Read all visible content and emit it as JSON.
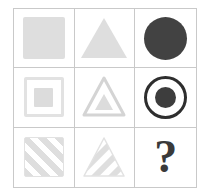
{
  "puzzle": {
    "type": "progressive-matrix",
    "rows": 3,
    "columns": 3,
    "border_color": "#c9c9c9",
    "background_color": "#ffffff",
    "light_shape_color": "#dedede",
    "dark_shape_color": "#424242",
    "missing_cell": "row-3-col-3",
    "cells": [
      {
        "id": "cell-1-1",
        "row": 1,
        "column": 1,
        "shape": "square",
        "style": "filled",
        "color": "#dedede",
        "label": "filled light gray square"
      },
      {
        "id": "cell-1-2",
        "row": 1,
        "column": 2,
        "shape": "triangle",
        "style": "filled",
        "color": "#dedede",
        "label": "filled light gray triangle"
      },
      {
        "id": "cell-1-3",
        "row": 1,
        "column": 3,
        "shape": "circle",
        "style": "filled",
        "color": "#424242",
        "label": "filled dark gray circle"
      },
      {
        "id": "cell-2-1",
        "row": 2,
        "column": 1,
        "shape": "square",
        "style": "outline-with-inner",
        "color": "#e2e2e2",
        "inner_color": "#dcdcdc",
        "label": "outlined square containing small square"
      },
      {
        "id": "cell-2-2",
        "row": 2,
        "column": 2,
        "shape": "triangle",
        "style": "outline-with-inner",
        "color": "#d4d4d4",
        "inner_color": "#dcdcdc",
        "label": "outlined triangle containing small triangle"
      },
      {
        "id": "cell-2-3",
        "row": 2,
        "column": 3,
        "shape": "circle",
        "style": "outline-with-inner",
        "color": "#2e2e2e",
        "inner_color": "#3d3d3d",
        "label": "dark ring containing filled circle"
      },
      {
        "id": "cell-3-1",
        "row": 3,
        "column": 1,
        "shape": "square",
        "style": "diagonal-striped",
        "color": "#dedede",
        "label": "square with diagonal stripes"
      },
      {
        "id": "cell-3-2",
        "row": 3,
        "column": 2,
        "shape": "triangle",
        "style": "diagonal-striped",
        "color": "#dedede",
        "label": "triangle with diagonal stripes"
      },
      {
        "id": "cell-3-3",
        "row": 3,
        "column": 3,
        "shape": "question-mark",
        "style": "text",
        "color": "#3a3a3a",
        "label": "missing answer",
        "text": "?"
      }
    ]
  }
}
